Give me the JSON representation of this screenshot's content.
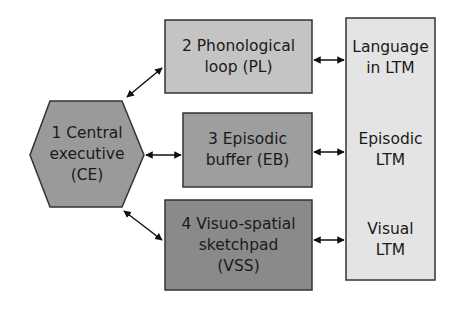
{
  "diagram": {
    "nodes": [
      {
        "id": "CE",
        "shape": "hexagon",
        "lines": [
          "1 Central",
          "executive",
          "(CE)"
        ],
        "fill": "#9a9a9a"
      },
      {
        "id": "PL",
        "shape": "rect",
        "lines": [
          "2 Phonological",
          "loop (PL)"
        ],
        "fill": "#c4c4c4"
      },
      {
        "id": "EB",
        "shape": "rect",
        "lines": [
          "3 Episodic",
          "buffer (EB)"
        ],
        "fill": "#9e9e9e"
      },
      {
        "id": "VSS",
        "shape": "rect",
        "lines": [
          "4 Visuo-spatial",
          "sketchpad",
          "(VSS)"
        ],
        "fill": "#8a8a8a"
      },
      {
        "id": "LTM",
        "shape": "rect",
        "fill": "#e4e4e4",
        "sections": [
          {
            "lines": [
              "Language",
              "in LTM"
            ]
          },
          {
            "lines": [
              "Episodic",
              "LTM"
            ]
          },
          {
            "lines": [
              "Visual",
              "LTM"
            ]
          }
        ]
      }
    ],
    "edges": [
      {
        "from": "CE",
        "to": "PL",
        "type": "bidirectional"
      },
      {
        "from": "CE",
        "to": "EB",
        "type": "bidirectional"
      },
      {
        "from": "CE",
        "to": "VSS",
        "type": "bidirectional"
      },
      {
        "from": "PL",
        "to": "LTM",
        "target_section": "Language in LTM",
        "type": "bidirectional"
      },
      {
        "from": "EB",
        "to": "LTM",
        "target_section": "Episodic LTM",
        "type": "bidirectional"
      },
      {
        "from": "VSS",
        "to": "LTM",
        "target_section": "Visual LTM",
        "type": "bidirectional"
      }
    ]
  }
}
